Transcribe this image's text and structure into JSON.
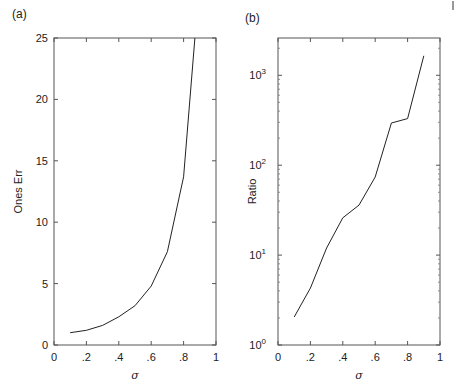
{
  "figure": {
    "corner_mark": "|"
  },
  "chart_data": [
    {
      "type": "line",
      "panel_label": "(a)",
      "title": "",
      "xlabel": "σ",
      "ylabel": "Ones Err",
      "xlim": [
        0,
        1
      ],
      "ylim": [
        0,
        25
      ],
      "yscale": "linear",
      "grid": false,
      "x_ticks": [
        0,
        0.2,
        0.4,
        0.6,
        0.8,
        1
      ],
      "x_tick_labels": [
        "0",
        ".2",
        ".4",
        ".6",
        ".8",
        "1"
      ],
      "y_ticks": [
        0,
        5,
        10,
        15,
        20,
        25
      ],
      "y_tick_labels": [
        "0",
        "5",
        "10",
        "15",
        "20",
        "25"
      ],
      "series": [
        {
          "name": "Ones Err",
          "x": [
            0.1,
            0.2,
            0.3,
            0.4,
            0.5,
            0.6,
            0.7,
            0.8,
            0.87
          ],
          "values": [
            1.0,
            1.2,
            1.6,
            2.3,
            3.2,
            4.8,
            7.6,
            13.7,
            25
          ]
        }
      ]
    },
    {
      "type": "line",
      "panel_label": "(b)",
      "title": "",
      "xlabel": "σ",
      "ylabel": "Ratio",
      "xlim": [
        0,
        1
      ],
      "ylim": [
        1,
        2600
      ],
      "yscale": "log",
      "grid": false,
      "x_ticks": [
        0,
        0.2,
        0.4,
        0.6,
        0.8,
        1
      ],
      "x_tick_labels": [
        "0",
        ".2",
        ".4",
        ".6",
        ".8",
        "1"
      ],
      "y_ticks": [
        1,
        10,
        100,
        1000
      ],
      "y_tick_labels": [
        {
          "base": "10",
          "exp": "0"
        },
        {
          "base": "10",
          "exp": "1"
        },
        {
          "base": "10",
          "exp": "2"
        },
        {
          "base": "10",
          "exp": "3"
        }
      ],
      "series": [
        {
          "name": "Ratio",
          "x": [
            0.1,
            0.2,
            0.3,
            0.4,
            0.5,
            0.6,
            0.7,
            0.8,
            0.9
          ],
          "values": [
            2.05,
            4.3,
            12,
            26,
            36,
            74,
            295,
            330,
            1650
          ]
        }
      ]
    }
  ]
}
